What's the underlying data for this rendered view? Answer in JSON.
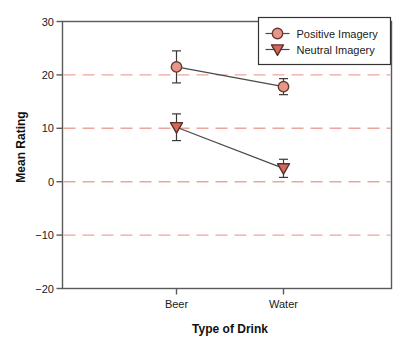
{
  "chart_data": {
    "type": "line",
    "title": "",
    "xlabel": "Type of Drink",
    "ylabel": "Mean Rating",
    "categories": [
      "Beer",
      "Water"
    ],
    "series": [
      {
        "name": "Positive Imagery",
        "marker": "circle",
        "values": [
          21.5,
          17.8
        ],
        "errors": [
          3.0,
          1.5
        ],
        "marker_fill": "#e69789",
        "marker_stroke": "#6d3a31"
      },
      {
        "name": "Neutral Imagery",
        "marker": "triangle-down",
        "values": [
          10.2,
          2.5
        ],
        "errors": [
          2.5,
          1.7
        ],
        "marker_fill": "#cf6a5d",
        "marker_stroke": "#5d2d26"
      }
    ],
    "ylim": [
      -20,
      30
    ],
    "yticks": [
      30,
      20,
      10,
      0,
      -10,
      -20
    ],
    "ytick_labels": [
      "30",
      "20",
      "10",
      "0",
      "−10",
      "−20"
    ],
    "gridline_values": [
      20,
      10,
      0,
      -10
    ],
    "grid_on": true,
    "legend_position": "top-right",
    "colors": {
      "gridline": "#eda69e",
      "axis_box": "#5a5a5a",
      "series_line": "#4a4a4a",
      "error_bar": "#383838",
      "legend_border": "#333333",
      "text": "#1a1a1a",
      "background": "#ffffff"
    }
  }
}
